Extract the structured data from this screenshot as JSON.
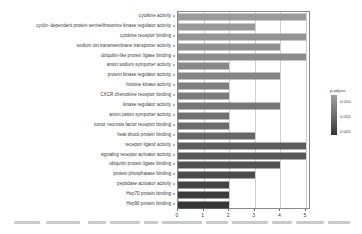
{
  "chart_data": {
    "type": "bar",
    "title": "",
    "xlabel": "",
    "ylabel": "",
    "orientation": "horizontal",
    "xlim": [
      0,
      5.2
    ],
    "xticks": [
      0,
      1,
      2,
      3,
      4,
      5
    ],
    "xticklabels": [
      "0",
      "1",
      "2",
      "3",
      "4",
      "5"
    ],
    "grid": true,
    "legend": {
      "title": "p.adjust",
      "position": "right",
      "ticks": [
        0.01,
        0.015,
        0.02
      ],
      "ticklabels": [
        "0.010",
        "0.015",
        "0.020"
      ],
      "low_color": "#333333",
      "high_color": "#9e9e9e"
    },
    "categories": [
      "cytokine activity",
      "cyclin−dependent protein serine/threonine kinase regulator activity",
      "cytokine receptor binding",
      "sodium ion transmembrane transporter activity",
      "ubiquitin-like protein ligase binding",
      "anion:sodium symporter activity",
      "protein kinase regulator activity",
      "histone kinase activity",
      "CXCR chemokine receptor binding",
      "kinase regulator activity",
      "anion:cation symporter activity",
      "tumor necrosis factor receptor binding",
      "heat shock protein binding",
      "receptor ligand activity",
      "signaling receptor activator activity",
      "ubiquitin protein ligase binding",
      "protein phosphatase binding",
      "peptidase activator activity",
      "Hsp70 protein binding",
      "Hsp90 protein binding"
    ],
    "values": [
      5,
      3,
      5,
      4,
      5,
      2,
      4,
      2,
      2,
      4,
      2,
      2,
      3,
      5,
      5,
      4,
      3,
      2,
      2,
      2
    ],
    "padjust": [
      0.0205,
      0.0205,
      0.02,
      0.0198,
      0.019,
      0.0185,
      0.0178,
      0.017,
      0.0165,
      0.0158,
      0.015,
      0.0142,
      0.0135,
      0.012,
      0.0115,
      0.0108,
      0.01,
      0.0092,
      0.0085,
      0.008
    ],
    "bar_colors": [
      "#9a9a9a",
      "#989898",
      "#949494",
      "#909090",
      "#8c8c8c",
      "#888888",
      "#848484",
      "#7f7f7f",
      "#7b7b7b",
      "#767676",
      "#717171",
      "#6c6c6c",
      "#666666",
      "#5d5d5d",
      "#585858",
      "#525252",
      "#4b4b4b",
      "#434343",
      "#3c3c3c",
      "#363636"
    ]
  },
  "caption": {
    "segments": [
      {
        "left": 0,
        "top": 2,
        "width": 26
      },
      {
        "left": 32,
        "top": 2,
        "width": 34
      },
      {
        "left": 74,
        "top": 2,
        "width": 18
      },
      {
        "left": 96,
        "top": 2,
        "width": 30
      },
      {
        "left": 130,
        "top": 2,
        "width": 14
      },
      {
        "left": 148,
        "top": 2,
        "width": 40
      },
      {
        "left": 192,
        "top": 2,
        "width": 22
      },
      {
        "left": 218,
        "top": 2,
        "width": 36
      },
      {
        "left": 258,
        "top": 2,
        "width": 20
      },
      {
        "left": 282,
        "top": 2,
        "width": 28
      },
      {
        "left": 314,
        "top": 2,
        "width": 22
      }
    ]
  }
}
